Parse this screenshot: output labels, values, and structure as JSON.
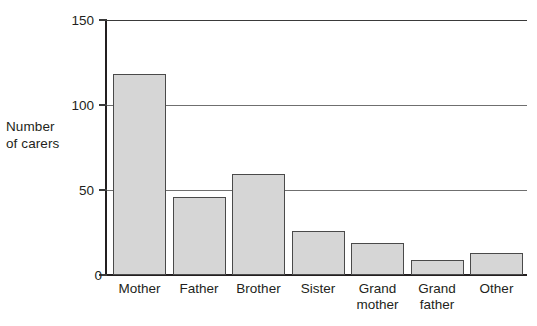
{
  "chart_data": {
    "type": "bar",
    "title": "",
    "xlabel": "",
    "ylabel": "Number of carers",
    "ylabel_lines": [
      "Number",
      "of carers"
    ],
    "categories": [
      "Mother",
      "Father",
      "Brother",
      "Sister",
      "Grand mother",
      "Grand father",
      "Other"
    ],
    "category_label_lines": [
      [
        "Mother"
      ],
      [
        "Father"
      ],
      [
        "Brother"
      ],
      [
        "Sister"
      ],
      [
        "Grand",
        "mother"
      ],
      [
        "Grand",
        "father"
      ],
      [
        "Other"
      ]
    ],
    "values": [
      118,
      46,
      59,
      26,
      19,
      9,
      13
    ],
    "ylim": [
      0,
      150
    ],
    "yticks": [
      0,
      50,
      100,
      150
    ],
    "ytick_labels": [
      "0",
      "50",
      "100",
      "150"
    ],
    "grid": true,
    "grid_axis": "y",
    "legend": null,
    "bar_fill_color": "#d6d6d6",
    "bar_border_color": "#4a4a4a",
    "axis_color": "#231f20",
    "gridline_color": "#6f6f6f",
    "background_color": "#ffffff"
  }
}
